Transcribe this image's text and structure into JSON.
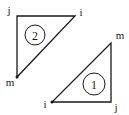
{
  "diagram": {
    "type": "triangular-finite-elements",
    "colors": {
      "line": "#1a1a1a",
      "background": "#ffffff"
    },
    "elements": [
      {
        "id": "element-2",
        "label": "2",
        "nodes": [
          {
            "name": "j",
            "label": "j",
            "x": 17,
            "y": 16
          },
          {
            "name": "i",
            "label": "i",
            "x": 75,
            "y": 16
          },
          {
            "name": "m",
            "label": "m",
            "x": 17,
            "y": 77
          }
        ],
        "circle": {
          "cx": 35,
          "cy": 35,
          "r": 10
        }
      },
      {
        "id": "element-1",
        "label": "1",
        "nodes": [
          {
            "name": "i",
            "label": "i",
            "x": 52,
            "y": 102
          },
          {
            "name": "j",
            "label": "j",
            "x": 111,
            "y": 102
          },
          {
            "name": "m",
            "label": "m",
            "x": 111,
            "y": 43
          }
        ],
        "circle": {
          "cx": 94,
          "cy": 84,
          "r": 11
        }
      }
    ]
  }
}
